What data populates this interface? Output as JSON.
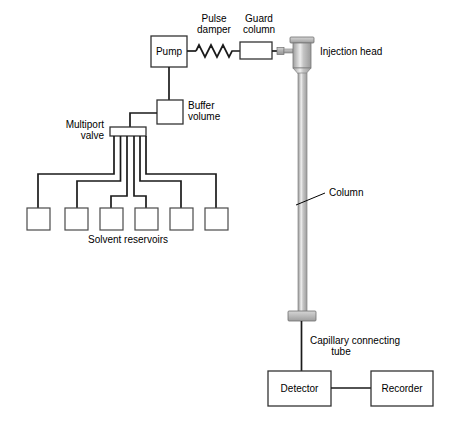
{
  "diagram": {
    "background_color": "#ffffff",
    "line_color": "#1a1a1a",
    "metal_color": "#b5b5b5",
    "metal_highlight": "#e8e8e8"
  },
  "components": {
    "pump": {
      "label": "Pump"
    },
    "pulse_damper": {
      "label_line1": "Pulse",
      "label_line2": "damper"
    },
    "guard_column": {
      "label_line1": "Guard",
      "label_line2": "column"
    },
    "injection_head": {
      "label": "Injection head"
    },
    "buffer_volume": {
      "label_line1": "Buffer",
      "label_line2": "volume"
    },
    "multiport_valve": {
      "label_line1": "Multiport",
      "label_line2": "valve"
    },
    "solvent_reservoirs": {
      "label": "Solvent reservoirs",
      "count": 6
    },
    "column": {
      "label": "Column"
    },
    "capillary_tube": {
      "label_line1": "Capillary connecting",
      "label_line2": "tube"
    },
    "detector": {
      "label": "Detector"
    },
    "recorder": {
      "label": "Recorder"
    }
  }
}
